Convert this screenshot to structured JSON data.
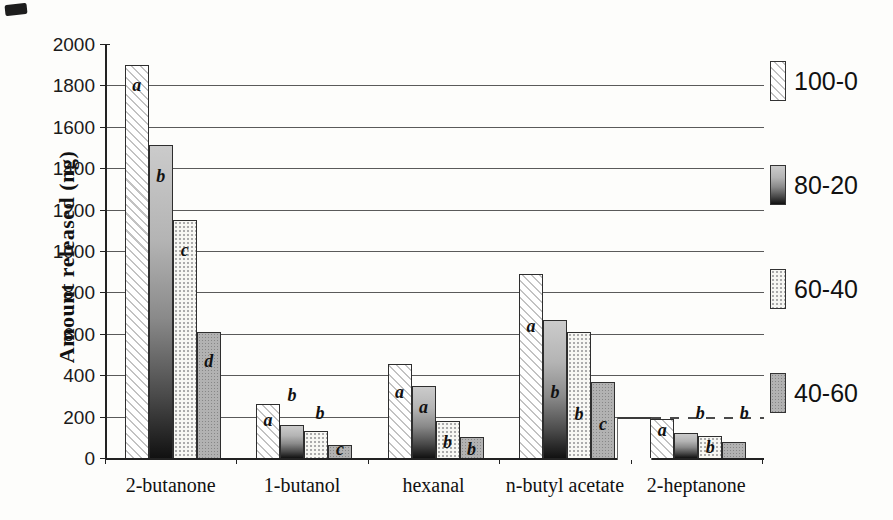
{
  "chart_data": {
    "type": "bar",
    "title": "",
    "xlabel": "",
    "ylabel": "Amount released (ng)",
    "ylim": [
      0,
      2000
    ],
    "yticks": [
      0,
      200,
      400,
      600,
      800,
      1000,
      1200,
      1400,
      1600,
      1800,
      2000
    ],
    "grid": "horizontal",
    "legend_position": "right",
    "categories": [
      "2-butanone",
      "1-butanol",
      "hexanal",
      "n-butyl acetate",
      "2-heptanone"
    ],
    "series": [
      {
        "name": "100-0",
        "pattern": "hatch",
        "values": [
          1900,
          260,
          455,
          890,
          190
        ]
      },
      {
        "name": "80-20",
        "pattern": "gradient",
        "values": [
          1510,
          160,
          350,
          665,
          120
        ]
      },
      {
        "name": "60-40",
        "pattern": "stipple-light",
        "values": [
          1150,
          130,
          180,
          610,
          105
        ]
      },
      {
        "name": "40-60",
        "pattern": "stipple-gray",
        "values": [
          610,
          65,
          100,
          365,
          75
        ]
      }
    ],
    "annotations": [
      {
        "cat": 0,
        "series": 0,
        "text": "a",
        "level": 1800
      },
      {
        "cat": 0,
        "series": 1,
        "text": "b",
        "level": 1360
      },
      {
        "cat": 0,
        "series": 2,
        "text": "c",
        "level": 1005
      },
      {
        "cat": 0,
        "series": 3,
        "text": "d",
        "level": 470
      },
      {
        "cat": 1,
        "series": 0,
        "text": "a",
        "level": 185
      },
      {
        "cat": 1,
        "series": 1,
        "text": "b",
        "level": 305
      },
      {
        "cat": 1,
        "series": 2,
        "text": "b",
        "level": 215,
        "dx": 4
      },
      {
        "cat": 1,
        "series": 3,
        "text": "c",
        "level": 42
      },
      {
        "cat": 2,
        "series": 0,
        "text": "a",
        "level": 320
      },
      {
        "cat": 2,
        "series": 1,
        "text": "a",
        "level": 245
      },
      {
        "cat": 2,
        "series": 2,
        "text": "b",
        "level": 75
      },
      {
        "cat": 2,
        "series": 3,
        "text": "b",
        "level": 42
      },
      {
        "cat": 3,
        "series": 0,
        "text": "a",
        "level": 640
      },
      {
        "cat": 3,
        "series": 1,
        "text": "b",
        "level": 320
      },
      {
        "cat": 3,
        "series": 2,
        "text": "b",
        "level": 213
      },
      {
        "cat": 3,
        "series": 3,
        "text": "c",
        "level": 165
      },
      {
        "cat": 4,
        "series": 0,
        "text": "a",
        "level": 135
      },
      {
        "cat": 4,
        "series": 1,
        "text": "b",
        "level": 217,
        "dx": 14
      },
      {
        "cat": 4,
        "series": 2,
        "text": "b",
        "level": 52
      },
      {
        "cat": 4,
        "series": 3,
        "text": "b",
        "level": 217,
        "dx": 10
      }
    ],
    "colors": {
      "axis": "#222222",
      "grid": "#5a5a5a",
      "bar_border": "#2e2e2e",
      "gradient_top": "#cbcbcb",
      "gradient_bottom": "#111111",
      "gray_fill": "#b2b2b2",
      "paper": "#fdfdfb"
    }
  }
}
